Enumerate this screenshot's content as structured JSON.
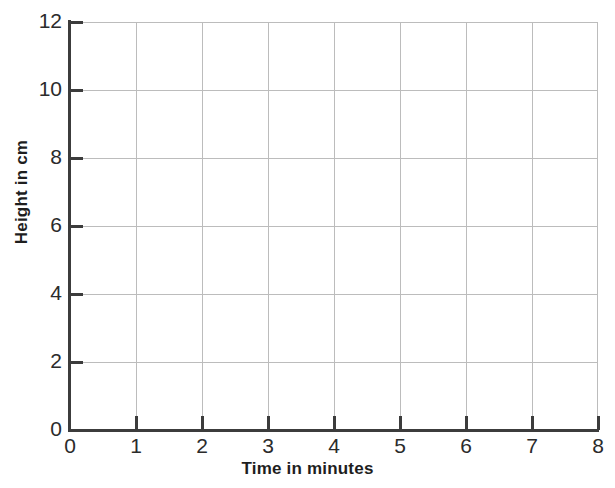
{
  "chart_data": {
    "type": "line",
    "title": "",
    "subtitle": "",
    "xlabel": "Time in minutes",
    "ylabel": "Height in cm",
    "xlim": [
      0,
      8
    ],
    "ylim": [
      0,
      12
    ],
    "xticks": [
      0,
      1,
      2,
      3,
      4,
      5,
      6,
      7,
      8
    ],
    "xtick_labels": [
      "0",
      "1",
      "2",
      "3",
      "4",
      "5",
      "6",
      "7",
      "8"
    ],
    "yticks": [
      0,
      2,
      4,
      6,
      8,
      10,
      12
    ],
    "ytick_labels": [
      "0",
      "2",
      "4",
      "6",
      "8",
      "10",
      "12"
    ],
    "grid": true,
    "grid_x_step": 1,
    "grid_y_step": 2,
    "legend": false,
    "legend_position": "none",
    "series": [],
    "values": [],
    "categories": [],
    "annotations": [],
    "note": "Blank graph grid with no plotted data points or lines."
  },
  "colors": {
    "background": "#ffffff",
    "gridline": "#bcbcbc",
    "axis_spine": "#3c3c3c",
    "tick_label": "#2b2b2b",
    "axis_title": "#1e1e1e"
  }
}
